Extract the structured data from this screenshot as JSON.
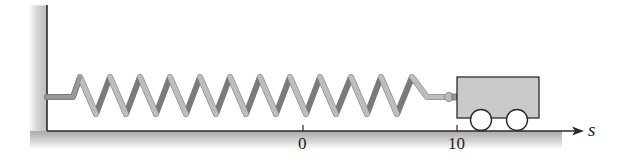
{
  "diagram": {
    "axis": {
      "name": "s",
      "ticks": [
        {
          "label": "0",
          "x": 303
        },
        {
          "label": "10",
          "x": 457
        }
      ]
    },
    "components": {
      "wall": "fixed-wall",
      "spring": {
        "coils": 12
      },
      "cart": {
        "wheels": 2
      }
    },
    "colors": {
      "line": "#2a2a2a",
      "spring_light": "#b8b8b8",
      "spring_dark": "#7a7a7a",
      "cart_fill": "#c9c9c9",
      "shade": "#cfcfcf"
    }
  }
}
